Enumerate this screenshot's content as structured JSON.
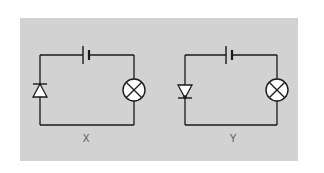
{
  "figure": {
    "background": "#ffffff",
    "panel_color": "#d2d2d2",
    "wire_color": "#1a1a1a",
    "circuits": [
      {
        "id": "X",
        "label": "X",
        "components": [
          "battery",
          "diode",
          "lamp"
        ],
        "diode_orientation": "pointing-up (reverse relative to Y)"
      },
      {
        "id": "Y",
        "label": "Y",
        "components": [
          "battery",
          "diode",
          "lamp"
        ],
        "diode_orientation": "pointing-down"
      }
    ]
  }
}
